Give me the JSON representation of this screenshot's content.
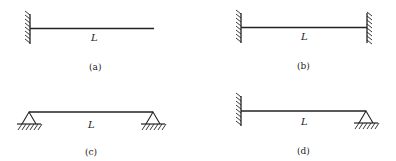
{
  "diagram": {
    "stroke_color": "#222222",
    "background_color": "#ffffff",
    "panels": [
      {
        "id": "a",
        "caption": "(a)",
        "length_label": "L",
        "left_support": "fixed",
        "right_support": "free"
      },
      {
        "id": "b",
        "caption": "(b)",
        "length_label": "L",
        "left_support": "fixed",
        "right_support": "fixed"
      },
      {
        "id": "c",
        "caption": "(c)",
        "length_label": "L",
        "left_support": "pinned",
        "right_support": "pinned"
      },
      {
        "id": "d",
        "caption": "(d)",
        "length_label": "L",
        "left_support": "fixed",
        "right_support": "pinned"
      }
    ]
  }
}
